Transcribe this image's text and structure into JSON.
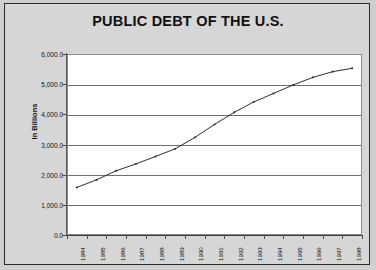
{
  "chart_data": {
    "type": "line",
    "title": "PUBLIC DEBT OF THE U.S.",
    "xlabel": "",
    "ylabel": "In Billions",
    "categories": [
      "1984",
      "1985",
      "1986",
      "1987",
      "1988",
      "1989",
      "1990",
      "1991",
      "1992",
      "1993",
      "1994",
      "1995",
      "1996",
      "1997",
      "1998"
    ],
    "values": [
      1577.0,
      1827.5,
      2130.0,
      2355.3,
      2602.3,
      2857.4,
      3233.3,
      3665.3,
      4064.6,
      4411.5,
      4692.7,
      4973.9,
      5224.8,
      5413.1,
      5526.2
    ],
    "series": [
      {
        "name": "Public Debt",
        "values": [
          1577.0,
          1827.5,
          2130.0,
          2355.3,
          2602.3,
          2857.4,
          3233.3,
          3665.3,
          4064.6,
          4411.5,
          4692.7,
          4973.9,
          5224.8,
          5413.1,
          5526.2
        ]
      }
    ],
    "ylim": [
      0,
      6000
    ],
    "yticks": [
      0,
      1000,
      2000,
      3000,
      4000,
      5000,
      6000
    ],
    "ytick_labels": [
      "0.0",
      "1,000.0",
      "2,000.0",
      "3,000.0",
      "4,000.0",
      "5,000.0",
      "6,000.0"
    ],
    "grid": true,
    "grid_axis": "y",
    "legend": false,
    "marker": "dot",
    "line_color": "#2e2e2e",
    "plot_background": "#ffffff",
    "chart_background": "#d6d6d6",
    "gridline_color": "#6f6f6f"
  }
}
